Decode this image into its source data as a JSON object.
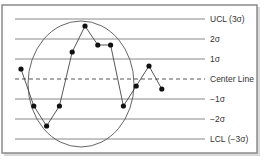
{
  "chart_data": {
    "type": "line",
    "title": "",
    "xlabel": "",
    "ylabel": "",
    "grid": false,
    "ylim": [
      -3,
      3
    ],
    "y_unit": "sigma",
    "control_lines": [
      {
        "value": 3,
        "label": "UCL (3σ)",
        "style": "solid"
      },
      {
        "value": 2,
        "label": "2σ",
        "style": "solid"
      },
      {
        "value": 1,
        "label": "1σ",
        "style": "solid"
      },
      {
        "value": 0,
        "label": "Center Line",
        "style": "dashed"
      },
      {
        "value": -1,
        "label": "−1σ",
        "style": "solid"
      },
      {
        "value": -2,
        "label": "−2σ",
        "style": "solid"
      },
      {
        "value": -3,
        "label": "LCL (−3σ)",
        "style": "solid"
      }
    ],
    "series": [
      {
        "name": "Process measurements",
        "x": [
          1,
          2,
          3,
          4,
          5,
          6,
          7,
          8,
          9,
          10,
          11,
          12
        ],
        "values": [
          0.5,
          -1.35,
          -2.35,
          -1.35,
          1.35,
          2.65,
          1.7,
          1.7,
          -1.35,
          -0.35,
          0.65,
          -0.5
        ]
      }
    ],
    "annotations": [
      {
        "type": "ellipse",
        "description": "Circled region highlighting points 2 through 9 (out-of-control pattern)"
      }
    ],
    "legend": null
  },
  "labels": {
    "ucl": "UCL (3σ)",
    "two_sigma": "2σ",
    "one_sigma": "1σ",
    "center": "Center Line",
    "neg_one_sigma": "−1σ",
    "neg_two_sigma": "−2σ",
    "lcl": "LCL (−3σ)"
  },
  "colors": {
    "frame": "#8a8a8a",
    "lines": "#7a7a7a",
    "points": "#111111",
    "text": "#333333"
  }
}
